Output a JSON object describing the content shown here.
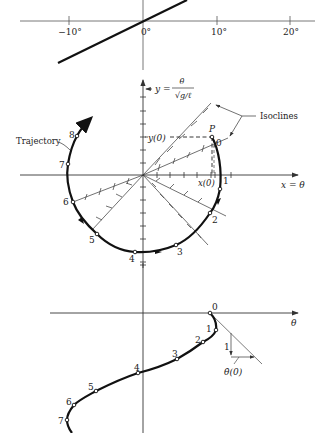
{
  "top_chart": {
    "x_ticks": [
      "−10°",
      "0°",
      "10°",
      "20°"
    ]
  },
  "phase_plane": {
    "y_axis_label": "y =",
    "y_axis_numer": "θ̇",
    "y_axis_denom": "√g/ℓ",
    "x_axis_label": "x = θ",
    "isoclines_label": "Isoclines",
    "trajectory_label": "Trajectory",
    "point_p_label": "P",
    "y0_label": "y(0)",
    "x0_label": "x(0)",
    "points": [
      "0",
      "1",
      "2",
      "3",
      "4",
      "5",
      "6",
      "7",
      "8"
    ]
  },
  "time_plot": {
    "x_axis_label": "θ",
    "points": [
      "0",
      "1",
      "2",
      "3",
      "4",
      "5",
      "6",
      "7"
    ],
    "slope_rise_label": "1",
    "slope_run_label": "θ̇(0)"
  },
  "colors": {
    "ink": "#111111",
    "axis": "#333333",
    "background": "#ffffff"
  }
}
